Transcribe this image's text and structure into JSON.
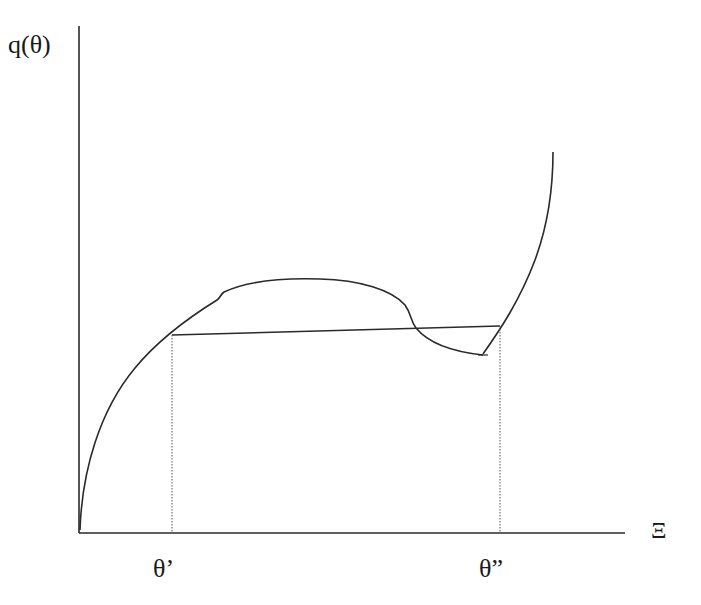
{
  "diagram": {
    "type": "common-tangent construction (free energy curve with tie line)",
    "y_axis_label": "q(θ)",
    "x_axis_label": "Ξ",
    "tick_labels": [
      "θ’",
      "θ”"
    ],
    "colors": {
      "line": "#2a2a2a",
      "background": "#ffffff"
    },
    "elements": [
      {
        "name": "y-axis",
        "kind": "axis",
        "from": [
          79,
          26
        ],
        "to": [
          79,
          533
        ]
      },
      {
        "name": "x-axis",
        "kind": "axis",
        "from": [
          79,
          533
        ],
        "to": [
          625,
          533
        ]
      },
      {
        "name": "left-curve-branch",
        "kind": "curve",
        "description": "concave rising branch from origin with small kink near top, arching over then dipping to a cusp"
      },
      {
        "name": "right-curve-branch",
        "kind": "curve",
        "description": "steep rising convex branch from cusp upward"
      },
      {
        "name": "tie-line",
        "kind": "line",
        "from": [
          172,
          335
        ],
        "to": [
          500,
          326
        ]
      },
      {
        "name": "theta-prime-guide",
        "kind": "dotted-line",
        "x": 172
      },
      {
        "name": "theta-double-prime-guide",
        "kind": "dotted-line",
        "x": 500
      }
    ]
  }
}
